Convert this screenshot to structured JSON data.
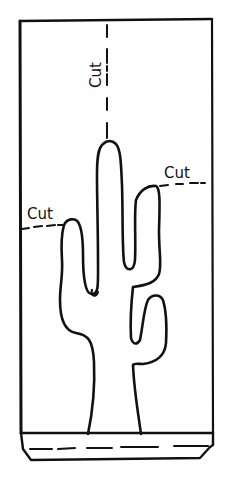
{
  "diagram": {
    "stroke_color": "#111111",
    "background": "#ffffff",
    "labels": {
      "top_cut": "Cut",
      "left_cut": "Cut",
      "right_cut": "Cut"
    },
    "elements": [
      "panel-outline",
      "cactus-outline",
      "cut-line-top-vertical",
      "cut-line-left-arm",
      "cut-line-right-arm",
      "base-strip",
      "base-fold-line"
    ]
  }
}
